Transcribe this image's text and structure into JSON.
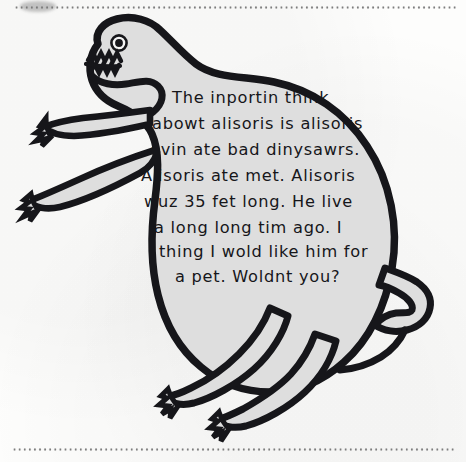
{
  "page": {
    "kind": "scanned-book-page",
    "background_color": "#fdfdfc",
    "width": 466,
    "height": 462
  },
  "decorations": {
    "top_rule": "dotted-rule",
    "bottom_rule": "dotted-rule",
    "corner_smudge": "grey-smudge"
  },
  "illustration": {
    "subject_name": "alisoris-dinosaur",
    "description": "hand-drawn dinosaur outlined in thick black ink with light grey body fill",
    "ink_color": "#1a1a1a",
    "body_fill_color": "#dedede",
    "parts": [
      {
        "name": "head",
        "label": "head"
      },
      {
        "name": "eye",
        "label": "eye"
      },
      {
        "name": "mouth",
        "label": "zigzag toothy mouth"
      },
      {
        "name": "front-arm-upper",
        "label": "upper front arm with claws"
      },
      {
        "name": "front-arm-lower",
        "label": "lower front arm with claws"
      },
      {
        "name": "body",
        "label": "body"
      },
      {
        "name": "tail",
        "label": "hooked tail"
      },
      {
        "name": "hind-leg-left",
        "label": "left hind leg with claws"
      },
      {
        "name": "hind-leg-right",
        "label": "right hind leg with claws"
      }
    ]
  },
  "handwriting": {
    "full_text": "The inportin think abowt alisoris is alisoris evin ate bad dinysawrs. Alisoris ate met. Alisoris wuz 35 fet long. He live a long long tim ago. I thing I wold like him for a pet. Woldnt you?",
    "ink_color": "#16161a",
    "lines": [
      {
        "text": "The inportin think",
        "x": 172,
        "y": 98
      },
      {
        "text": "abowt alisoris is alisoris",
        "x": 152,
        "y": 124
      },
      {
        "text": "evin ate bad dinysawrs.",
        "x": 150,
        "y": 150
      },
      {
        "text": "Alisoris ate met. Alisoris",
        "x": 141,
        "y": 176
      },
      {
        "text": "wuz 35 fet long. He live",
        "x": 144,
        "y": 202
      },
      {
        "text": "a long long tim ago. I",
        "x": 154,
        "y": 228
      },
      {
        "text": "thing I wold like him for",
        "x": 159,
        "y": 252
      },
      {
        "text": "a pet. Woldnt you?",
        "x": 175,
        "y": 277
      }
    ]
  }
}
